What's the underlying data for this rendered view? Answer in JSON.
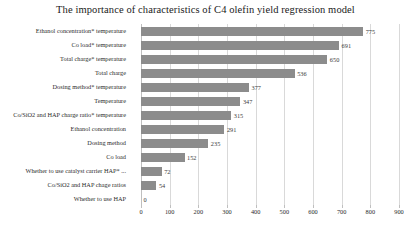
{
  "chart_data": {
    "type": "bar",
    "orientation": "horizontal",
    "title": "The importance of characteristics of C4 olefin yield regression model",
    "xlabel": "",
    "ylabel": "",
    "xlim": [
      0,
      900
    ],
    "xticks": [
      0,
      100,
      200,
      300,
      400,
      500,
      600,
      700,
      800,
      900
    ],
    "grid": true,
    "legend": false,
    "bar_color": "#8c8c8c",
    "categories": [
      "Ethanol concentration* temperature",
      "Co load* temperature",
      "Total charge* temperature",
      "Total charge",
      "Dosing method* temperature",
      "Temperature",
      "Co/SiO2 and HAP charge ratio* temperature",
      "Ethanol concentration",
      "Dosing method",
      "Co load",
      "Whether to use catalyst carrier HAP* ...",
      "Co/SiO2 and HAP chage ratios",
      "Whether to use HAP"
    ],
    "values": [
      775,
      691,
      650,
      536,
      377,
      347,
      315,
      291,
      235,
      152,
      72,
      54,
      0
    ]
  }
}
